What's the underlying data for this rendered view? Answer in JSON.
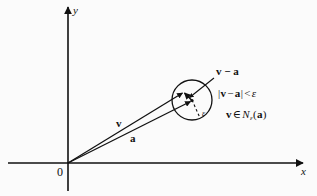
{
  "figure": {
    "kind": "vector-neighborhood-diagram",
    "background_color": "#fbfbfb",
    "ink_color": "#111111",
    "axes": {
      "x_label": "x",
      "y_label": "y",
      "origin_label": "0",
      "origin_px": [
        68,
        163
      ],
      "x_axis_end_px": [
        307,
        163
      ],
      "y_axis_top_px": [
        68,
        4
      ]
    },
    "vectors": [
      {
        "name": "v",
        "label": "v",
        "from_px": [
          68,
          163
        ],
        "to_px": [
          184,
          92
        ]
      },
      {
        "name": "a",
        "label": "a",
        "from_px": [
          68,
          163
        ],
        "to_px": [
          192,
          101
        ]
      }
    ],
    "difference_vector": {
      "label": "v − a",
      "from_px": [
        192,
        101
      ],
      "to_px": [
        184,
        92
      ]
    },
    "neighborhood_circle": {
      "center_px": [
        192,
        100
      ],
      "radius_px": 20,
      "radius_label": "ε"
    },
    "conditions": [
      {
        "id": "distance-condition",
        "parts": [
          "|",
          "v",
          " − ",
          "a",
          "|",
          " < ",
          "ε"
        ],
        "text": "|v − a| < ε"
      },
      {
        "id": "membership-condition",
        "parts": [
          "v",
          " ∈ ",
          "N",
          "ε",
          "(",
          "a",
          ")"
        ],
        "text": "v ∈ Nε(a)"
      }
    ],
    "condition_tokens": {
      "bar_open": "|",
      "bar_close": "|",
      "v": "v",
      "minus": "−",
      "a": "a",
      "less_than": "<",
      "epsilon": "ε",
      "element_of": "∈",
      "N": "N",
      "paren_open": "(",
      "paren_close": ")"
    }
  }
}
